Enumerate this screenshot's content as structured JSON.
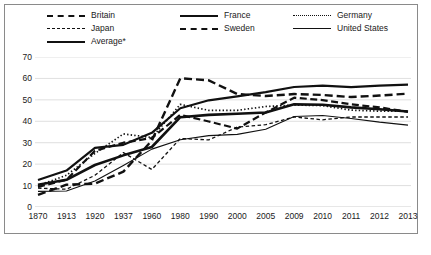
{
  "legend": {
    "items": [
      {
        "label": "Britain",
        "style": "s-britain",
        "col": 0,
        "row": 0
      },
      {
        "label": "Japan",
        "style": "s-japan",
        "col": 0,
        "row": 1
      },
      {
        "label": "Average*",
        "style": "s-average",
        "col": 0,
        "row": 2
      },
      {
        "label": "France",
        "style": "s-france",
        "col": 1,
        "row": 0
      },
      {
        "label": "Sweden",
        "style": "s-sweden",
        "col": 1,
        "row": 1
      },
      {
        "label": "Germany",
        "style": "s-germany",
        "col": 2,
        "row": 0
      },
      {
        "label": "United States",
        "style": "s-us",
        "col": 2,
        "row": 1
      }
    ]
  },
  "chart_data": {
    "type": "line",
    "title": "",
    "subtitle": "",
    "xlabel": "",
    "ylabel": "",
    "grid": true,
    "legend_position": "top",
    "ylim": [
      0,
      70
    ],
    "yticks": [
      0,
      10,
      20,
      30,
      40,
      50,
      60,
      70
    ],
    "categories": [
      "1870",
      "1913",
      "1920",
      "1937",
      "1960",
      "1980",
      "1990",
      "2000",
      "2005",
      "2009",
      "2010",
      "2011",
      "2012",
      "2013"
    ],
    "series": [
      {
        "name": "Britain",
        "style": "s-britain",
        "dash": "7,3.5",
        "width": 2.2,
        "values": [
          9.4,
          12.7,
          26.2,
          30.0,
          32.2,
          43.0,
          39.9,
          36.6,
          44.1,
          51.0,
          49.9,
          47.9,
          46.5,
          44.4
        ]
      },
      {
        "name": "Japan",
        "style": "s-japan",
        "dash": "3.5,2.5",
        "width": 1.3,
        "values": [
          8.8,
          8.3,
          14.8,
          25.4,
          17.5,
          32.0,
          31.3,
          37.3,
          38.4,
          42.0,
          40.7,
          42.0,
          42.0,
          42.0
        ]
      },
      {
        "name": "Average*",
        "style": "s-average",
        "dash": "none",
        "width": 2.6,
        "values": [
          10.4,
          12.7,
          19.6,
          24.1,
          28.0,
          41.9,
          43.0,
          43.5,
          44.1,
          47.9,
          47.7,
          46.5,
          45.6,
          44.6
        ]
      },
      {
        "name": "France",
        "style": "s-france",
        "dash": "none",
        "width": 2.2,
        "values": [
          12.6,
          17.0,
          27.6,
          29.0,
          34.6,
          46.1,
          49.8,
          51.6,
          53.6,
          56.0,
          56.6,
          55.9,
          56.6,
          57.1
        ]
      },
      {
        "name": "Sweden",
        "style": "s-sweden",
        "dash": "8,4",
        "width": 2.4,
        "values": [
          5.7,
          10.4,
          10.9,
          16.5,
          31.0,
          60.1,
          59.1,
          52.7,
          51.8,
          52.7,
          52.3,
          51.3,
          52.0,
          52.9
        ]
      },
      {
        "name": "Germany",
        "style": "s-germany",
        "dash": "1.4,2.2",
        "width": 1.7,
        "values": [
          10.0,
          14.8,
          25.0,
          34.1,
          32.4,
          47.9,
          45.1,
          45.1,
          46.9,
          47.6,
          47.3,
          45.2,
          44.7,
          44.7
        ]
      },
      {
        "name": "United States",
        "style": "s-us",
        "dash": "none",
        "width": 1.1,
        "values": [
          7.3,
          7.5,
          12.1,
          19.4,
          27.0,
          31.4,
          33.3,
          33.9,
          36.3,
          42.2,
          42.7,
          41.3,
          39.6,
          38.2
        ]
      }
    ]
  }
}
